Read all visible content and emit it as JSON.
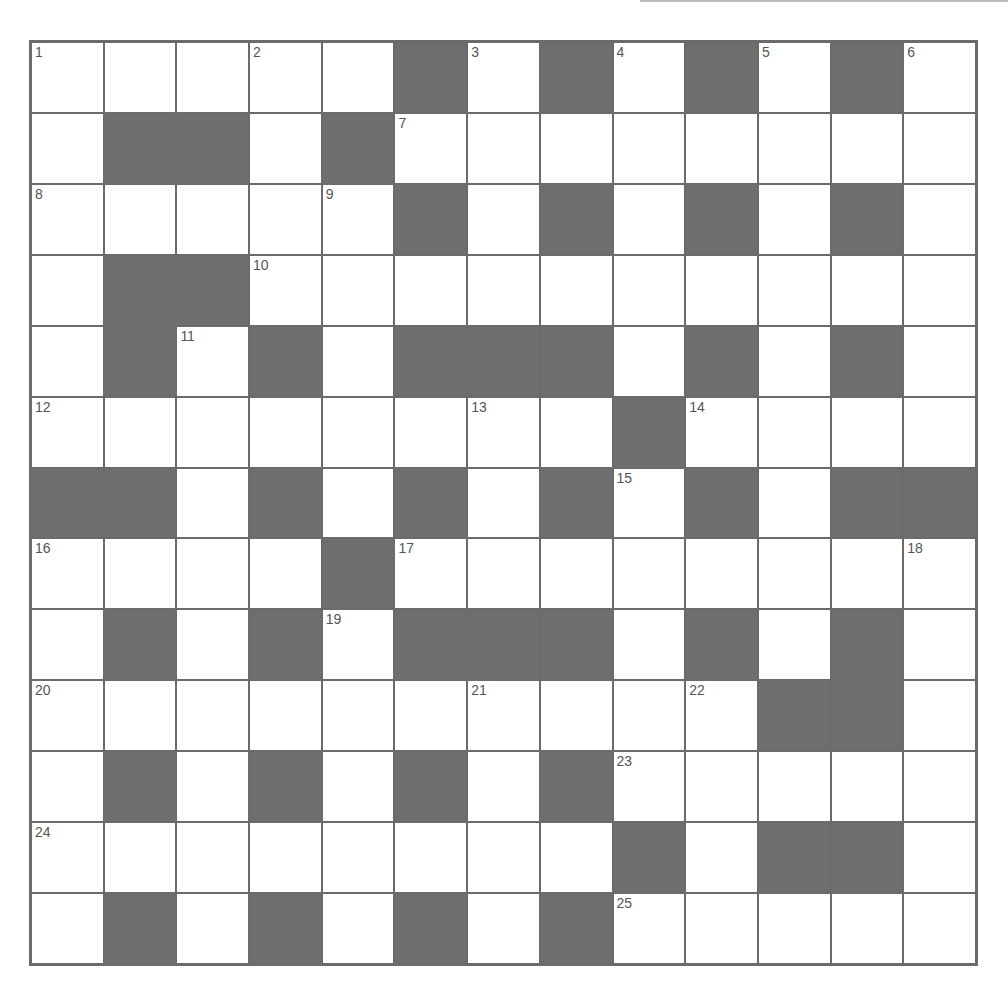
{
  "puzzle": {
    "size": 13,
    "colors": {
      "block": "#6e6e6e",
      "cell": "#ffffff",
      "line": "#6b6b6b",
      "number": "#555555"
    },
    "rows": [
      "WWWWWBWBWBWBW",
      "WBBWBWWWWWWWW",
      "WWWWWBWBWBWBW",
      "WBBWWWWWWWWWW",
      "WBWBWBBBWBWBW",
      "WWWWWWWWBWWWW",
      "BBWBWBWBWBWBB",
      "WWWWBWWWWWWWW",
      "WBWBWBBBWBWBW",
      "WWWWWWWWWWBBW",
      "WBWBWBWBWWWWW",
      "WWWWWWWWBWBBW",
      "WBWBWBWBWWWWW"
    ],
    "numbers": [
      {
        "r": 0,
        "c": 0,
        "n": "1"
      },
      {
        "r": 0,
        "c": 3,
        "n": "2"
      },
      {
        "r": 0,
        "c": 6,
        "n": "3"
      },
      {
        "r": 0,
        "c": 8,
        "n": "4"
      },
      {
        "r": 0,
        "c": 10,
        "n": "5"
      },
      {
        "r": 0,
        "c": 12,
        "n": "6"
      },
      {
        "r": 1,
        "c": 5,
        "n": "7"
      },
      {
        "r": 2,
        "c": 0,
        "n": "8"
      },
      {
        "r": 2,
        "c": 4,
        "n": "9"
      },
      {
        "r": 3,
        "c": 3,
        "n": "10"
      },
      {
        "r": 4,
        "c": 2,
        "n": "11"
      },
      {
        "r": 5,
        "c": 0,
        "n": "12"
      },
      {
        "r": 5,
        "c": 6,
        "n": "13"
      },
      {
        "r": 5,
        "c": 9,
        "n": "14"
      },
      {
        "r": 6,
        "c": 8,
        "n": "15"
      },
      {
        "r": 7,
        "c": 0,
        "n": "16"
      },
      {
        "r": 7,
        "c": 5,
        "n": "17"
      },
      {
        "r": 7,
        "c": 12,
        "n": "18"
      },
      {
        "r": 8,
        "c": 4,
        "n": "19"
      },
      {
        "r": 9,
        "c": 0,
        "n": "20"
      },
      {
        "r": 9,
        "c": 6,
        "n": "21"
      },
      {
        "r": 9,
        "c": 9,
        "n": "22"
      },
      {
        "r": 10,
        "c": 8,
        "n": "23"
      },
      {
        "r": 11,
        "c": 0,
        "n": "24"
      },
      {
        "r": 12,
        "c": 8,
        "n": "25"
      }
    ]
  }
}
